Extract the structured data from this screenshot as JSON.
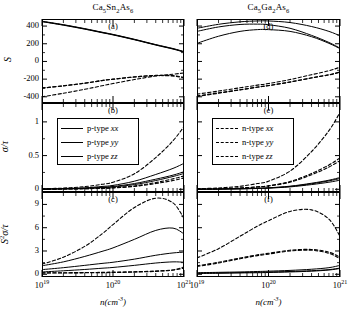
{
  "figure": {
    "width": 359,
    "height": 315,
    "columns": [
      {
        "title": "Ca5Sn2As6",
        "title_parts": [
          "Ca",
          "5",
          "Sn",
          "2",
          "As",
          "6"
        ]
      },
      {
        "title": "Ca5Ga2As6",
        "title_parts": [
          "Ca",
          "5",
          "Ga",
          "2",
          "As",
          "6"
        ]
      }
    ],
    "xlabel": "n(cm-3)",
    "xtick_labels": [
      "10^19",
      "10^20",
      "10^21"
    ],
    "row_ylabels": [
      "S",
      "σ/τ",
      "S²σ/τ"
    ],
    "panel_tags": [
      "(a)",
      "(b)",
      "(c)",
      "(d)",
      "(e)",
      "(f)"
    ],
    "row0_yticks": [
      "400",
      "200",
      "0",
      "-200",
      "-400"
    ],
    "row1_yticks": [
      "1",
      "0.5",
      "0"
    ],
    "row2_yticks": [
      "9",
      "6",
      "3",
      "0"
    ],
    "line_color": "#000000",
    "axis_color": "#000000"
  },
  "legends": [
    {
      "panel": "(b)",
      "style": "solid",
      "entries": [
        {
          "label": "p-type xx",
          "prefix": "p-type ",
          "component": "xx"
        },
        {
          "label": "p-type yy",
          "prefix": "p-type ",
          "component": "yy"
        },
        {
          "label": "p-type zz",
          "prefix": "p-type ",
          "component": "zz"
        }
      ]
    },
    {
      "panel": "(e)",
      "style": "dashed",
      "entries": [
        {
          "label": "n-type xx",
          "prefix": "n-type ",
          "component": "xx"
        },
        {
          "label": "n-type yy",
          "prefix": "n-type ",
          "component": "yy"
        },
        {
          "label": "n-type zz",
          "prefix": "n-type ",
          "component": "zz"
        }
      ]
    }
  ],
  "chart_data": {
    "type": "line",
    "xlabel": "n(cm-3)",
    "xscale": "log",
    "xlim": [
      1e+19,
      1e+21
    ],
    "xticks": [
      1e+19,
      1e+20,
      1e+21
    ],
    "grid": false,
    "legend_position": "upper-left in middle row panels",
    "panels": [
      {
        "tag": "(a)",
        "column": "Ca5Sn2As6",
        "ylabel": "S",
        "ylim": [
          -470,
          480
        ],
        "yticks": [
          400,
          200,
          0,
          -200,
          -400
        ],
        "x": [
          1e+19,
          2e+19,
          4e+19,
          7e+19,
          1e+20,
          2e+20,
          4e+20,
          7e+20,
          1e+21
        ],
        "series": [
          {
            "name": "p-type xx",
            "style": "solid",
            "values": [
              450,
              410,
              365,
              325,
              300,
              245,
              185,
              140,
              105
            ]
          },
          {
            "name": "p-type yy",
            "style": "solid",
            "values": [
              452,
              413,
              368,
              328,
              303,
              248,
              188,
              143,
              108
            ]
          },
          {
            "name": "p-type zz",
            "style": "solid",
            "values": [
              455,
              416,
              371,
              331,
              306,
              251,
              191,
              146,
              112
            ]
          },
          {
            "name": "n-type xx",
            "style": "dashed",
            "values": [
              -300,
              -275,
              -245,
              -215,
              -200,
              -175,
              -160,
              -165,
              -185
            ]
          },
          {
            "name": "n-type yy",
            "style": "dashed",
            "values": [
              -302,
              -277,
              -247,
              -217,
              -202,
              -176,
              -158,
              -160,
              -180
            ]
          },
          {
            "name": "n-type zz",
            "style": "dashed",
            "values": [
              -400,
              -360,
              -315,
              -275,
              -250,
              -205,
              -165,
              -145,
              -130
            ]
          }
        ]
      },
      {
        "tag": "(b)",
        "column": "Ca5Sn2As6",
        "ylabel": "sigma/tau",
        "ylim": [
          -0.04,
          1.28
        ],
        "yticks": [
          1,
          0.5,
          0
        ],
        "x": [
          1e+19,
          2e+19,
          4e+19,
          7e+19,
          1e+20,
          2e+20,
          4e+20,
          7e+20,
          1e+21
        ],
        "series": [
          {
            "name": "p-type xx",
            "style": "solid",
            "values": [
              0.004,
              0.008,
              0.016,
              0.03,
              0.042,
              0.085,
              0.15,
              0.21,
              0.26
            ]
          },
          {
            "name": "p-type yy",
            "style": "solid",
            "values": [
              0.003,
              0.006,
              0.013,
              0.024,
              0.034,
              0.07,
              0.13,
              0.19,
              0.235
            ]
          },
          {
            "name": "p-type zz",
            "style": "solid",
            "values": [
              0.005,
              0.011,
              0.022,
              0.042,
              0.058,
              0.12,
              0.22,
              0.31,
              0.385
            ]
          },
          {
            "name": "n-type xx",
            "style": "dashed",
            "values": [
              0.002,
              0.004,
              0.009,
              0.016,
              0.023,
              0.05,
              0.1,
              0.155,
              0.2
            ]
          },
          {
            "name": "n-type yy",
            "style": "dashed",
            "values": [
              0.002,
              0.004,
              0.008,
              0.014,
              0.02,
              0.043,
              0.085,
              0.13,
              0.17
            ]
          },
          {
            "name": "n-type zz",
            "style": "dashed",
            "values": [
              0.008,
              0.018,
              0.04,
              0.075,
              0.105,
              0.23,
              0.47,
              0.72,
              0.93
            ]
          }
        ]
      },
      {
        "tag": "(c)",
        "column": "Ca5Sn2As6",
        "ylabel": "S^2 sigma/tau",
        "ylim": [
          -0.35,
          10.6
        ],
        "yticks": [
          9,
          6,
          3,
          0
        ],
        "x": [
          1e+19,
          2e+19,
          4e+19,
          7e+19,
          1e+20,
          2e+20,
          4e+20,
          7e+20,
          1e+21
        ],
        "series": [
          {
            "name": "p-type xx",
            "style": "solid",
            "values": [
              0.6,
              0.85,
              1.15,
              1.4,
              1.55,
              1.95,
              2.45,
              2.75,
              2.85
            ]
          },
          {
            "name": "p-type yy",
            "style": "solid",
            "values": [
              0.3,
              0.45,
              0.62,
              0.78,
              0.88,
              1.15,
              1.45,
              1.6,
              1.55
            ]
          },
          {
            "name": "p-type zz",
            "style": "solid",
            "values": [
              1.1,
              1.6,
              2.3,
              2.95,
              3.4,
              4.5,
              5.65,
              5.95,
              5.2
            ]
          },
          {
            "name": "n-type xx",
            "style": "dashed",
            "values": [
              0.18,
              0.2,
              0.22,
              0.25,
              0.28,
              0.33,
              0.42,
              0.55,
              0.78
            ]
          },
          {
            "name": "n-type yy",
            "style": "dashed",
            "values": [
              0.16,
              0.17,
              0.19,
              0.21,
              0.23,
              0.28,
              0.38,
              0.55,
              0.95
            ]
          },
          {
            "name": "n-type zz",
            "style": "dashed",
            "values": [
              1.3,
              2.2,
              3.6,
              5.2,
              6.4,
              8.6,
              9.8,
              9.2,
              7.2
            ]
          }
        ]
      },
      {
        "tag": "(d)",
        "column": "Ca5Ga2As6",
        "ylabel": "S",
        "ylim": [
          -470,
          480
        ],
        "yticks": [
          400,
          200,
          0,
          -200,
          -400
        ],
        "x": [
          1e+19,
          2e+19,
          4e+19,
          7e+19,
          1e+20,
          2e+20,
          4e+20,
          7e+20,
          1e+21
        ],
        "series": [
          {
            "name": "p-type xx",
            "style": "solid",
            "values": [
              375,
              420,
              448,
              458,
              458,
              440,
              395,
              340,
              290
            ]
          },
          {
            "name": "p-type yy",
            "style": "solid",
            "values": [
              340,
              390,
              418,
              422,
              415,
              375,
              295,
              215,
              150
            ]
          },
          {
            "name": "p-type zz",
            "style": "solid",
            "values": [
              205,
              285,
              340,
              360,
              360,
              340,
              280,
              205,
              145
            ]
          },
          {
            "name": "n-type xx",
            "style": "dashed",
            "values": [
              -390,
              -355,
              -320,
              -290,
              -272,
              -232,
              -185,
              -150,
              -120
            ]
          },
          {
            "name": "n-type yy",
            "style": "dashed",
            "values": [
              -395,
              -360,
              -322,
              -292,
              -274,
              -234,
              -187,
              -152,
              -122
            ]
          },
          {
            "name": "n-type zz",
            "style": "dashed",
            "values": [
              -370,
              -335,
              -298,
              -268,
              -250,
              -205,
              -150,
              -105,
              -65
            ]
          }
        ]
      },
      {
        "tag": "(e)",
        "column": "Ca5Ga2As6",
        "ylabel": "sigma/tau",
        "ylim": [
          -0.04,
          1.28
        ],
        "yticks": [
          1,
          0.5,
          0
        ],
        "x": [
          1e+19,
          2e+19,
          4e+19,
          7e+19,
          1e+20,
          2e+20,
          4e+20,
          7e+20,
          1e+21
        ],
        "series": [
          {
            "name": "p-type xx",
            "style": "solid",
            "values": [
              0.002,
              0.004,
              0.008,
              0.014,
              0.02,
              0.042,
              0.082,
              0.125,
              0.16
            ]
          },
          {
            "name": "p-type yy",
            "style": "solid",
            "values": [
              0.002,
              0.003,
              0.007,
              0.012,
              0.017,
              0.036,
              0.07,
              0.105,
              0.135
            ]
          },
          {
            "name": "p-type zz",
            "style": "solid",
            "values": [
              0.002,
              0.004,
              0.009,
              0.016,
              0.022,
              0.046,
              0.09,
              0.135,
              0.175
            ]
          },
          {
            "name": "n-type xx",
            "style": "dashed",
            "values": [
              0.004,
              0.009,
              0.02,
              0.037,
              0.053,
              0.115,
              0.235,
              0.36,
              0.465
            ]
          },
          {
            "name": "n-type yy",
            "style": "dashed",
            "values": [
              0.004,
              0.008,
              0.018,
              0.034,
              0.048,
              0.105,
              0.215,
              0.33,
              0.425
            ]
          },
          {
            "name": "n-type zz",
            "style": "dashed",
            "values": [
              0.009,
              0.02,
              0.045,
              0.085,
              0.12,
              0.27,
              0.56,
              0.87,
              1.14
            ]
          }
        ]
      },
      {
        "tag": "(f)",
        "column": "Ca5Ga2As6",
        "ylabel": "S^2 sigma/tau",
        "ylim": [
          -0.35,
          10.6
        ],
        "yticks": [
          9,
          6,
          3,
          0
        ],
        "x": [
          1e+19,
          2e+19,
          4e+19,
          7e+19,
          1e+20,
          2e+20,
          4e+20,
          7e+20,
          1e+21
        ],
        "series": [
          {
            "name": "p-type xx",
            "style": "solid",
            "values": [
              0.2,
              0.25,
              0.3,
              0.36,
              0.4,
              0.5,
              0.65,
              0.85,
              1.15
            ]
          },
          {
            "name": "p-type yy",
            "style": "solid",
            "values": [
              0.15,
              0.18,
              0.22,
              0.26,
              0.29,
              0.36,
              0.46,
              0.6,
              0.8
            ]
          },
          {
            "name": "p-type zz",
            "style": "solid",
            "values": [
              0.1,
              0.13,
              0.17,
              0.2,
              0.23,
              0.3,
              0.4,
              0.55,
              0.75
            ]
          },
          {
            "name": "n-type xx",
            "style": "dashed",
            "values": [
              1.1,
              1.55,
              2.1,
              2.5,
              2.7,
              3.1,
              3.2,
              2.85,
              2.2
            ]
          },
          {
            "name": "n-type yy",
            "style": "dashed",
            "values": [
              1.0,
              1.45,
              2.0,
              2.4,
              2.6,
              3.0,
              3.1,
              2.7,
              2.0
            ]
          },
          {
            "name": "n-type zz",
            "style": "dashed",
            "values": [
              2.1,
              3.3,
              4.9,
              6.2,
              6.9,
              8.1,
              8.3,
              7.1,
              4.9
            ]
          }
        ]
      }
    ]
  }
}
